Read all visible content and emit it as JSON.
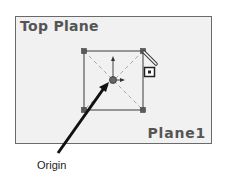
{
  "viewport": {
    "top_left_label": "Top Plane",
    "bottom_right_label": "Plane1",
    "background_color": "#f1f1f1",
    "border_color": "#6a6a6a"
  },
  "sketch": {
    "shape": "square",
    "handles": 4,
    "line_color": "#666666",
    "construction_line_color": "#aaaaaa",
    "icons": [
      "origin-icon",
      "pencil-icon",
      "sketch-relation-icon"
    ]
  },
  "callout": {
    "label": "Origin",
    "arrow_color": "#111111"
  }
}
